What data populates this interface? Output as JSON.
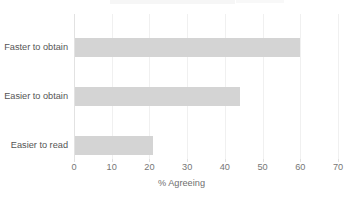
{
  "chart_data": {
    "type": "bar",
    "orientation": "horizontal",
    "title": "",
    "xlabel": "% Agreeing",
    "ylabel": "",
    "xlim": [
      0,
      70
    ],
    "xticks": [
      0,
      10,
      20,
      30,
      40,
      50,
      60,
      70
    ],
    "xtick_labels": [
      "0",
      "10",
      "20",
      "30",
      "40",
      "50",
      "60",
      "70"
    ],
    "grid": true,
    "legend": false,
    "categories": [
      "Faster to obtain",
      "Easier to obtain",
      "Easier to read"
    ],
    "values": [
      60,
      44,
      21
    ],
    "bar_color": "#d4d4d4",
    "gridline_color": "#f0f0f0",
    "axis_color": "#e2e2e2",
    "text_color": "#555555"
  }
}
